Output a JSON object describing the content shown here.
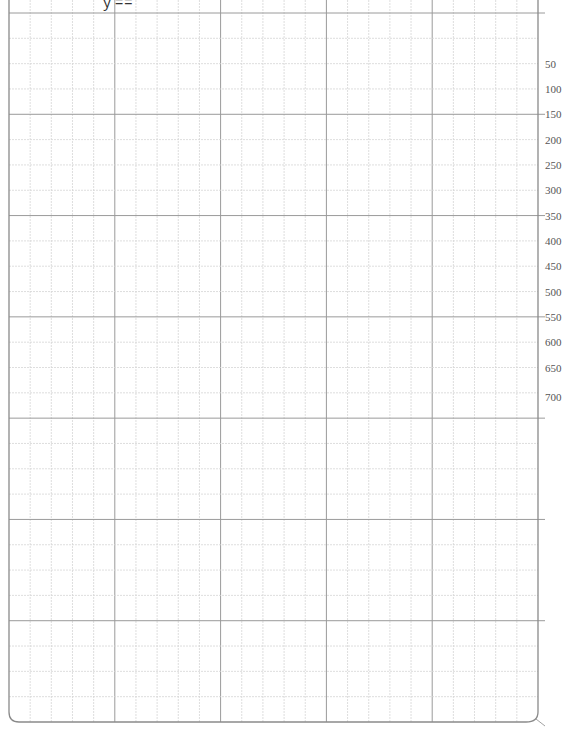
{
  "sheet": {
    "title_fragment": "ｙ==",
    "colors": {
      "frame": "#8a8a8a",
      "major": "#9a9a9a",
      "minor": "#d6d6d6",
      "label": "#555555"
    },
    "ruler_labels": [
      "50",
      "100",
      "150",
      "200",
      "250",
      "300",
      "350",
      "400",
      "450",
      "500",
      "550",
      "600",
      "650",
      "700"
    ]
  }
}
